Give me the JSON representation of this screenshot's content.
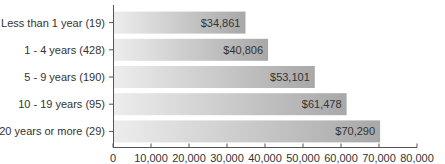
{
  "chart_data": {
    "type": "bar",
    "orientation": "horizontal",
    "title": "",
    "xlabel": "",
    "ylabel": "",
    "categories": [
      "Less than 1 year (19)",
      "1 - 4 years (428)",
      "5 - 9 years (190)",
      "10 - 19 years (95)",
      "20 years or more (29)"
    ],
    "values": [
      34861,
      40806,
      53101,
      61478,
      70290
    ],
    "data_labels": [
      "$34,861",
      "$40,806",
      "$53,101",
      "$61,478",
      "$70,290"
    ],
    "xlim": [
      0,
      80000
    ],
    "xticks": [
      0,
      10000,
      20000,
      30000,
      40000,
      50000,
      60000,
      70000,
      80000
    ],
    "xtick_labels": [
      "0",
      "10,000",
      "20,000",
      "30,000",
      "40,000",
      "50,000",
      "60,000",
      "70,000",
      "80,000"
    ],
    "grid": false,
    "legend": "none",
    "colors": {
      "bar_start": "#ededed",
      "bar_end": "#a8a8a8",
      "axis": "#555555",
      "text": "#333333"
    }
  }
}
